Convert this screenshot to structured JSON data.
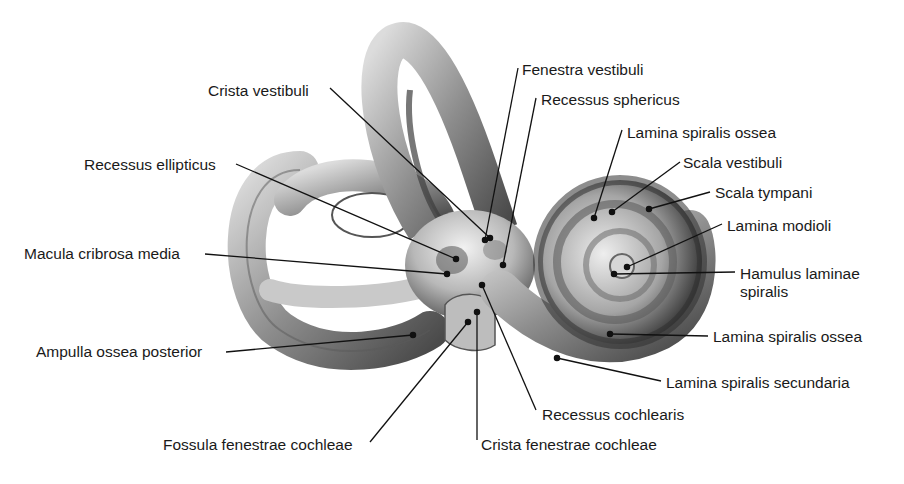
{
  "figure": {
    "colors": {
      "background": "#ffffff",
      "bone_light": "#e6e6e6",
      "bone_mid": "#9a9a9a",
      "bone_dark": "#3a3a3a",
      "line": "#111111",
      "text": "#1a1a1a"
    }
  },
  "labels": [
    {
      "id": "crista-vestibuli",
      "text": "Crista vestibuli",
      "x": 208,
      "y": 82,
      "align": "left",
      "line": [
        [
          330,
          88
        ],
        [
          490,
          238
        ]
      ]
    },
    {
      "id": "fenestra-vestibuli",
      "text": "Fenestra vestibuli",
      "x": 522,
      "y": 61,
      "align": "left",
      "line": [
        [
          518,
          68
        ],
        [
          485,
          240
        ]
      ]
    },
    {
      "id": "recessus-sphericus",
      "text": "Recessus sphericus",
      "x": 541,
      "y": 91,
      "align": "left",
      "line": [
        [
          536,
          98
        ],
        [
          503,
          265
        ]
      ]
    },
    {
      "id": "recessus-ellipticus",
      "text": "Recessus ellipticus",
      "x": 84,
      "y": 156,
      "align": "left",
      "line": [
        [
          236,
          164
        ],
        [
          456,
          259
        ]
      ]
    },
    {
      "id": "macula-cribrosa-media",
      "text": "Macula cribrosa media",
      "x": 24,
      "y": 245,
      "align": "left",
      "line": [
        [
          205,
          254
        ],
        [
          447,
          274
        ]
      ]
    },
    {
      "id": "ampulla-ossea-posterior",
      "text": "Ampulla ossea posterior",
      "x": 36,
      "y": 343,
      "align": "left",
      "line": [
        [
          226,
          352
        ],
        [
          413,
          335
        ]
      ]
    },
    {
      "id": "fossula-fenestrae-cochleae",
      "text": "Fossula fenestrae cochleae",
      "x": 163,
      "y": 436,
      "align": "left",
      "line": [
        [
          370,
          442
        ],
        [
          468,
          322
        ]
      ]
    },
    {
      "id": "crista-fenestrae-cochleae",
      "text": "Crista fenestrae cochleae",
      "x": 481,
      "y": 436,
      "align": "left",
      "line": [
        [
          477,
          440
        ],
        [
          477,
          312
        ]
      ]
    },
    {
      "id": "recessus-cochlearis",
      "text": "Recessus cochlearis",
      "x": 542,
      "y": 406,
      "align": "left",
      "line": [
        [
          536,
          410
        ],
        [
          482,
          285
        ]
      ]
    },
    {
      "id": "lamina-spiralis-ossea-top",
      "text": "Lamina spiralis ossea",
      "x": 627,
      "y": 124,
      "align": "left",
      "line": [
        [
          622,
          130
        ],
        [
          594,
          218
        ]
      ]
    },
    {
      "id": "scala-vestibuli",
      "text": "Scala vestibuli",
      "x": 683,
      "y": 154,
      "align": "left",
      "line": [
        [
          680,
          162
        ],
        [
          612,
          212
        ]
      ]
    },
    {
      "id": "scala-tympani",
      "text": "Scala tympani",
      "x": 715,
      "y": 184,
      "align": "left",
      "line": [
        [
          710,
          192
        ],
        [
          649,
          209
        ]
      ]
    },
    {
      "id": "lamina-modioli",
      "text": "Lamina modioli",
      "x": 727,
      "y": 217,
      "align": "left",
      "line": [
        [
          722,
          224
        ],
        [
          627,
          267
        ]
      ]
    },
    {
      "id": "hamulus-laminae-spiralis",
      "text": "Hamulus laminae\nspiralis",
      "x": 740,
      "y": 265,
      "align": "left",
      "line": [
        [
          735,
          272
        ],
        [
          614,
          274
        ]
      ]
    },
    {
      "id": "lamina-spiralis-ossea-bottom",
      "text": "Lamina spiralis ossea",
      "x": 713,
      "y": 328,
      "align": "left",
      "line": [
        [
          708,
          336
        ],
        [
          610,
          334
        ]
      ]
    },
    {
      "id": "lamina-spiralis-secundaria",
      "text": "Lamina spiralis secundaria",
      "x": 666,
      "y": 374,
      "align": "left",
      "line": [
        [
          661,
          381
        ],
        [
          557,
          358
        ]
      ]
    }
  ]
}
